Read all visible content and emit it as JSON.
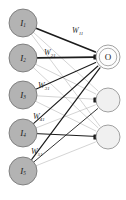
{
  "figure": {
    "type": "neural-network-diagram",
    "title": "",
    "background_color": "#ffffff",
    "width": 126,
    "height": 200
  },
  "style": {
    "input_node_fill": "#b3b3b3",
    "input_node_stroke": "#6e6e6e",
    "output_node_primary_fill": "#fdfdfd",
    "output_node_secondary_fill": "#f0f0f0",
    "output_node_stroke": "#8a8a8a",
    "edge_strong_color": "#1c1c1c",
    "edge_weak_color": "#a9a9a9",
    "arrow_color": "#1c1c1c",
    "label_color": "#1a1a1a"
  },
  "input_layer": {
    "name": "input-layer",
    "count": 5,
    "nodes": [
      {
        "id": "I1",
        "label": "I",
        "subscript": "1",
        "cx": 23,
        "cy": 23,
        "r": 14
      },
      {
        "id": "I2",
        "label": "I",
        "subscript": "2",
        "cx": 23,
        "cy": 58,
        "r": 14
      },
      {
        "id": "I3",
        "label": "I",
        "subscript": "3",
        "cx": 23,
        "cy": 95,
        "r": 14
      },
      {
        "id": "I4",
        "label": "I",
        "subscript": "4",
        "cx": 23,
        "cy": 133,
        "r": 14
      },
      {
        "id": "I5",
        "label": "I",
        "subscript": "5",
        "cx": 23,
        "cy": 171,
        "r": 14
      }
    ]
  },
  "output_layer": {
    "name": "output-layer",
    "count": 3,
    "nodes": [
      {
        "id": "O1",
        "label": "O",
        "cx": 108,
        "cy": 57,
        "r": 12,
        "labeled": true
      },
      {
        "id": "O2",
        "label": "",
        "cx": 108,
        "cy": 100,
        "r": 12,
        "labeled": false
      },
      {
        "id": "O3",
        "label": "",
        "cx": 108,
        "cy": 137,
        "r": 12,
        "labeled": false
      }
    ]
  },
  "weights": [
    {
      "id": "W11",
      "symbol": "W",
      "subscript": "11",
      "from": "I1",
      "to": "O1",
      "x": 72,
      "y": 33
    },
    {
      "id": "W21",
      "symbol": "W",
      "subscript": "21",
      "from": "I2",
      "to": "O1",
      "x": 44,
      "y": 55
    },
    {
      "id": "W31",
      "symbol": "W",
      "subscript": "31",
      "from": "I3",
      "to": "O1",
      "x": 38,
      "y": 88
    },
    {
      "id": "W41",
      "symbol": "W",
      "subscript": "41",
      "from": "I4",
      "to": "O1",
      "x": 33,
      "y": 119
    },
    {
      "id": "W51",
      "symbol": "W",
      "subscript": "51",
      "from": "I5",
      "to": "O1",
      "x": 31,
      "y": 154
    }
  ],
  "edges": [
    {
      "from": "I1",
      "to": "O1",
      "weight_class": "strong",
      "stroke": 1.6
    },
    {
      "from": "I1",
      "to": "O2",
      "weight_class": "weak",
      "stroke": 0.5
    },
    {
      "from": "I1",
      "to": "O3",
      "weight_class": "weak",
      "stroke": 0.5
    },
    {
      "from": "I2",
      "to": "O1",
      "weight_class": "strong",
      "stroke": 1.7
    },
    {
      "from": "I2",
      "to": "O2",
      "weight_class": "weak",
      "stroke": 0.5
    },
    {
      "from": "I2",
      "to": "O3",
      "weight_class": "weak",
      "stroke": 0.5
    },
    {
      "from": "I3",
      "to": "O1",
      "weight_class": "strong",
      "stroke": 1.1
    },
    {
      "from": "I3",
      "to": "O2",
      "weight_class": "weak",
      "stroke": 0.5
    },
    {
      "from": "I3",
      "to": "O3",
      "weight_class": "weak",
      "stroke": 0.5
    },
    {
      "from": "I4",
      "to": "O1",
      "weight_class": "strong",
      "stroke": 1.1
    },
    {
      "from": "I4",
      "to": "O2",
      "weight_class": "weak",
      "stroke": 0.5
    },
    {
      "from": "I4",
      "to": "O3",
      "weight_class": "strong",
      "stroke": 1.0
    },
    {
      "from": "I5",
      "to": "O1",
      "weight_class": "strong",
      "stroke": 1.2
    },
    {
      "from": "I5",
      "to": "O2",
      "weight_class": "strong",
      "stroke": 0.9
    },
    {
      "from": "I5",
      "to": "O3",
      "weight_class": "weak",
      "stroke": 0.5
    }
  ],
  "arrowheads": [
    {
      "at": "O1",
      "x": 95,
      "y": 57
    },
    {
      "at": "O2",
      "x": 95,
      "y": 100
    },
    {
      "at": "O3",
      "x": 95,
      "y": 137
    }
  ]
}
